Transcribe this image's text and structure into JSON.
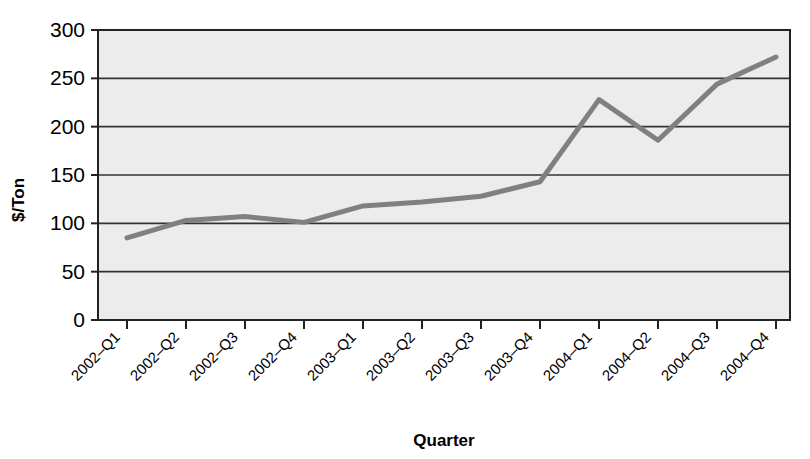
{
  "chart_data": {
    "type": "line",
    "title": "",
    "xlabel": "Quarter",
    "ylabel": "$/Ton",
    "categories": [
      "2002–Q1",
      "2002–Q2",
      "2002–Q3",
      "2002–Q4",
      "2003–Q1",
      "2003–Q2",
      "2003–Q3",
      "2003–Q4",
      "2004–Q1",
      "2004–Q2",
      "2004–Q3",
      "2004–Q4"
    ],
    "values": [
      85,
      103,
      107,
      101,
      118,
      122,
      128,
      143,
      228,
      186,
      244,
      272
    ],
    "ylim": [
      0,
      300
    ],
    "yticks": [
      0,
      50,
      100,
      150,
      200,
      250,
      300
    ],
    "ytick_labels": [
      "0",
      "50",
      "100",
      "150",
      "200",
      "250",
      "300"
    ],
    "grid": true,
    "grid_axis": "y",
    "legend": false,
    "legend_position": "none",
    "xtick_label_rotation": 45,
    "colors": {
      "line": "#808080",
      "plot_background": "#ececec",
      "gridline": "#333333",
      "axis": "#222222",
      "text": "#000000",
      "page_background": "#ffffff"
    }
  }
}
